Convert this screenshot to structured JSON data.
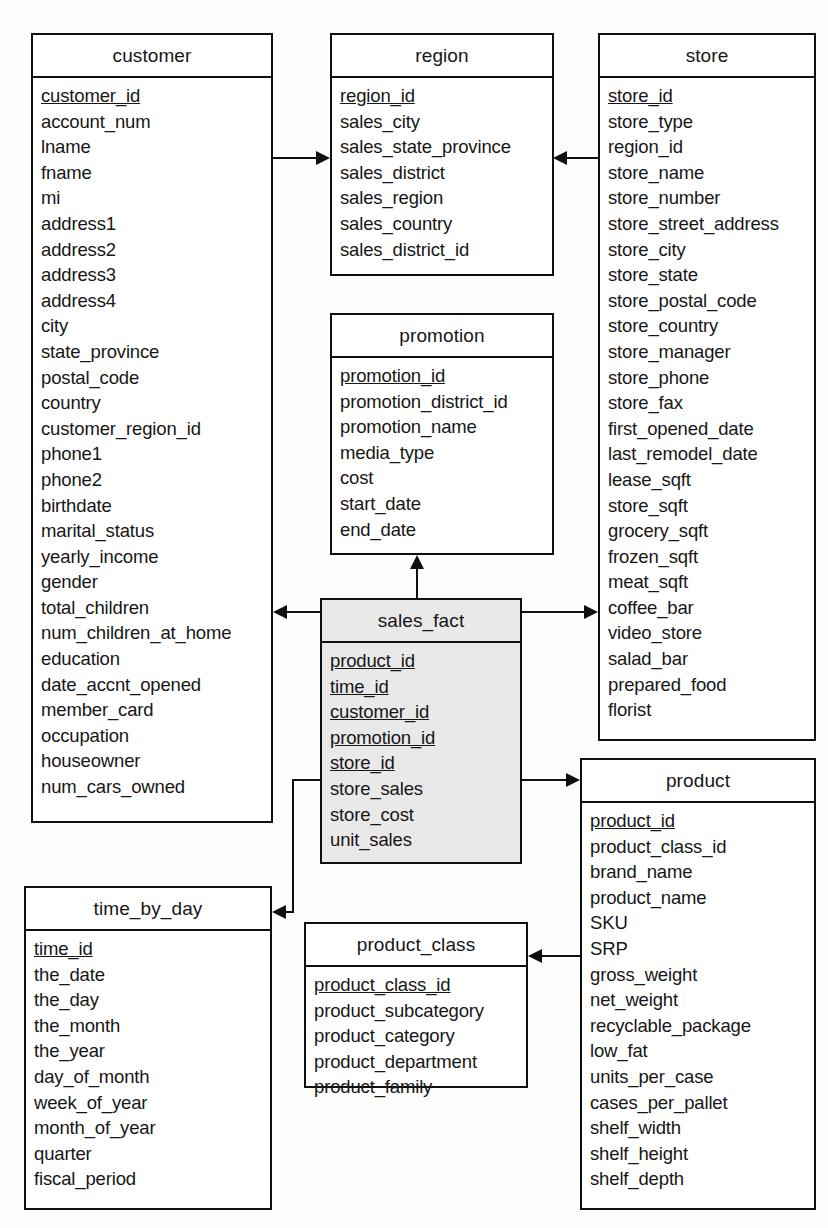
{
  "diagram": {
    "type": "entity-relationship-diagram",
    "fact_table": "sales_fact",
    "colors": {
      "background": "#fdfdfc",
      "stroke": "#101010",
      "entity_fill": "#ffffff",
      "fact_fill": "#e9e9e9"
    }
  },
  "entities": {
    "customer": {
      "name": "customer",
      "attributes": [
        {
          "name": "customer_id",
          "key": true
        },
        {
          "name": "account_num",
          "key": false
        },
        {
          "name": "lname",
          "key": false
        },
        {
          "name": "fname",
          "key": false
        },
        {
          "name": "mi",
          "key": false
        },
        {
          "name": "address1",
          "key": false
        },
        {
          "name": "address2",
          "key": false
        },
        {
          "name": "address3",
          "key": false
        },
        {
          "name": "address4",
          "key": false
        },
        {
          "name": "city",
          "key": false
        },
        {
          "name": "state_province",
          "key": false
        },
        {
          "name": "postal_code",
          "key": false
        },
        {
          "name": "country",
          "key": false
        },
        {
          "name": "customer_region_id",
          "key": false
        },
        {
          "name": "phone1",
          "key": false
        },
        {
          "name": "phone2",
          "key": false
        },
        {
          "name": "birthdate",
          "key": false
        },
        {
          "name": "marital_status",
          "key": false
        },
        {
          "name": "yearly_income",
          "key": false
        },
        {
          "name": "gender",
          "key": false
        },
        {
          "name": "total_children",
          "key": false
        },
        {
          "name": "num_children_at_home",
          "key": false
        },
        {
          "name": "education",
          "key": false
        },
        {
          "name": "date_accnt_opened",
          "key": false
        },
        {
          "name": "member_card",
          "key": false
        },
        {
          "name": "occupation",
          "key": false
        },
        {
          "name": "houseowner",
          "key": false
        },
        {
          "name": "num_cars_owned",
          "key": false
        }
      ]
    },
    "region": {
      "name": "region",
      "attributes": [
        {
          "name": "region_id",
          "key": true
        },
        {
          "name": "sales_city",
          "key": false
        },
        {
          "name": "sales_state_province",
          "key": false
        },
        {
          "name": "sales_district",
          "key": false
        },
        {
          "name": "sales_region",
          "key": false
        },
        {
          "name": "sales_country",
          "key": false
        },
        {
          "name": "sales_district_id",
          "key": false
        }
      ]
    },
    "store": {
      "name": "store",
      "attributes": [
        {
          "name": "store_id",
          "key": true
        },
        {
          "name": "store_type",
          "key": false
        },
        {
          "name": "region_id",
          "key": false
        },
        {
          "name": "store_name",
          "key": false
        },
        {
          "name": "store_number",
          "key": false
        },
        {
          "name": "store_street_address",
          "key": false
        },
        {
          "name": "store_city",
          "key": false
        },
        {
          "name": "store_state",
          "key": false
        },
        {
          "name": "store_postal_code",
          "key": false
        },
        {
          "name": "store_country",
          "key": false
        },
        {
          "name": "store_manager",
          "key": false
        },
        {
          "name": "store_phone",
          "key": false
        },
        {
          "name": "store_fax",
          "key": false
        },
        {
          "name": "first_opened_date",
          "key": false
        },
        {
          "name": "last_remodel_date",
          "key": false
        },
        {
          "name": "lease_sqft",
          "key": false
        },
        {
          "name": "store_sqft",
          "key": false
        },
        {
          "name": "grocery_sqft",
          "key": false
        },
        {
          "name": "frozen_sqft",
          "key": false
        },
        {
          "name": "meat_sqft",
          "key": false
        },
        {
          "name": "coffee_bar",
          "key": false
        },
        {
          "name": "video_store",
          "key": false
        },
        {
          "name": "salad_bar",
          "key": false
        },
        {
          "name": "prepared_food",
          "key": false
        },
        {
          "name": "florist",
          "key": false
        }
      ]
    },
    "promotion": {
      "name": "promotion",
      "attributes": [
        {
          "name": "promotion_id",
          "key": true
        },
        {
          "name": "promotion_district_id",
          "key": false
        },
        {
          "name": "promotion_name",
          "key": false
        },
        {
          "name": "media_type",
          "key": false
        },
        {
          "name": "cost",
          "key": false
        },
        {
          "name": "start_date",
          "key": false
        },
        {
          "name": "end_date",
          "key": false
        }
      ]
    },
    "sales_fact": {
      "name": "sales_fact",
      "attributes": [
        {
          "name": "product_id",
          "key": true
        },
        {
          "name": "time_id",
          "key": true
        },
        {
          "name": "customer_id",
          "key": true
        },
        {
          "name": "promotion_id",
          "key": true
        },
        {
          "name": "store_id",
          "key": true
        },
        {
          "name": "store_sales",
          "key": false
        },
        {
          "name": "store_cost",
          "key": false
        },
        {
          "name": "unit_sales",
          "key": false
        }
      ]
    },
    "product": {
      "name": "product",
      "attributes": [
        {
          "name": "product_id",
          "key": true
        },
        {
          "name": "product_class_id",
          "key": false
        },
        {
          "name": "brand_name",
          "key": false
        },
        {
          "name": "product_name",
          "key": false
        },
        {
          "name": "SKU",
          "key": false
        },
        {
          "name": "SRP",
          "key": false
        },
        {
          "name": "gross_weight",
          "key": false
        },
        {
          "name": "net_weight",
          "key": false
        },
        {
          "name": "recyclable_package",
          "key": false
        },
        {
          "name": "low_fat",
          "key": false
        },
        {
          "name": "units_per_case",
          "key": false
        },
        {
          "name": "cases_per_pallet",
          "key": false
        },
        {
          "name": "shelf_width",
          "key": false
        },
        {
          "name": "shelf_height",
          "key": false
        },
        {
          "name": "shelf_depth",
          "key": false
        }
      ]
    },
    "product_class": {
      "name": "product_class",
      "attributes": [
        {
          "name": "product_class_id",
          "key": true
        },
        {
          "name": "product_subcategory",
          "key": false
        },
        {
          "name": "product_category",
          "key": false
        },
        {
          "name": "product_department",
          "key": false
        },
        {
          "name": "product_family",
          "key": false
        }
      ]
    },
    "time_by_day": {
      "name": "time_by_day",
      "attributes": [
        {
          "name": "time_id",
          "key": true
        },
        {
          "name": "the_date",
          "key": false
        },
        {
          "name": "the_day",
          "key": false
        },
        {
          "name": "the_month",
          "key": false
        },
        {
          "name": "the_year",
          "key": false
        },
        {
          "name": "day_of_month",
          "key": false
        },
        {
          "name": "week_of_year",
          "key": false
        },
        {
          "name": "month_of_year",
          "key": false
        },
        {
          "name": "quarter",
          "key": false
        },
        {
          "name": "fiscal_period",
          "key": false
        }
      ]
    }
  },
  "relationships": [
    {
      "from": "customer",
      "to": "region",
      "direction": "right"
    },
    {
      "from": "store",
      "to": "region",
      "direction": "left"
    },
    {
      "from": "sales_fact",
      "to": "promotion",
      "direction": "up"
    },
    {
      "from": "sales_fact",
      "to": "customer",
      "direction": "left"
    },
    {
      "from": "sales_fact",
      "to": "store",
      "direction": "right"
    },
    {
      "from": "sales_fact",
      "to": "product",
      "direction": "right"
    },
    {
      "from": "sales_fact",
      "to": "time_by_day",
      "direction": "left"
    },
    {
      "from": "product",
      "to": "product_class",
      "direction": "left"
    }
  ]
}
